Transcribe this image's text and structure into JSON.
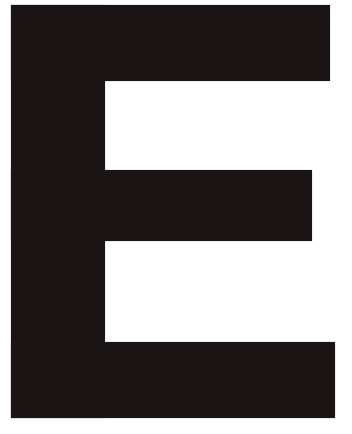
{
  "image": {
    "letter": "E",
    "background_color": "#ffffff",
    "fill_color": "#1a1414"
  }
}
